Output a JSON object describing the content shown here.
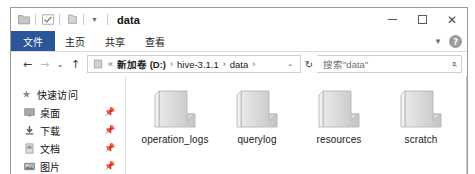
{
  "window": {
    "title": "data",
    "quick_access_icons": [
      "folder-icon",
      "properties-icon",
      "new-folder-icon",
      "customize-caret-icon"
    ],
    "controls": {
      "minimize": "minimize-icon",
      "maximize": "maximize-icon",
      "close": "close-icon"
    }
  },
  "ribbon": {
    "tabs": [
      {
        "label": "文件",
        "active": true
      },
      {
        "label": "主页",
        "active": false
      },
      {
        "label": "共享",
        "active": false
      },
      {
        "label": "查看",
        "active": false
      }
    ],
    "expand_icon": "chevron-down-icon",
    "help_label": "?",
    "file_tab_color": "#2b579a"
  },
  "address": {
    "back_icon": "←",
    "forward_icon": "→",
    "recent_icon": "⌄",
    "up_icon": "↑",
    "location_icon": "drive-icon",
    "overflow": "«",
    "crumbs": [
      {
        "label": "新加卷 (D:)",
        "bold": true
      },
      {
        "label": "hive-3.1.1",
        "bold": false
      },
      {
        "label": "data",
        "bold": false
      }
    ],
    "crumb_separator": "›",
    "dropdown_icon": "⌄",
    "refresh_icon": "↻"
  },
  "search": {
    "placeholder": "搜索\"data\"",
    "icon": "search-icon"
  },
  "nav_pane": {
    "items": [
      {
        "label": "快速访问",
        "icon": "pin-star-icon",
        "pinned": false,
        "root": true
      },
      {
        "label": "桌面",
        "icon": "desktop-icon",
        "pinned": true,
        "root": false
      },
      {
        "label": "下载",
        "icon": "downloads-icon",
        "pinned": true,
        "root": false
      },
      {
        "label": "文档",
        "icon": "documents-icon",
        "pinned": true,
        "root": false
      },
      {
        "label": "图片",
        "icon": "pictures-icon",
        "pinned": true,
        "root": false
      }
    ],
    "pin_icon": "📌"
  },
  "files": {
    "items": [
      {
        "name": "operation_logs",
        "icon": "folder-icon"
      },
      {
        "name": "querylog",
        "icon": "folder-icon"
      },
      {
        "name": "resources",
        "icon": "folder-icon"
      },
      {
        "name": "scratch",
        "icon": "folder-icon"
      }
    ]
  }
}
